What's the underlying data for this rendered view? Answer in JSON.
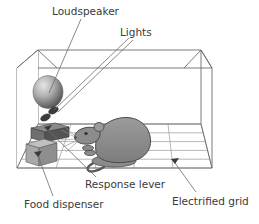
{
  "figure": {
    "background_color": "#ffffff",
    "line_color": "#6b6b6b",
    "label_color": "#3a3a3a"
  },
  "labels": {
    "loudspeaker": "Loudspeaker",
    "lights": "Lights",
    "response_lever": "Response lever",
    "food_dispenser": "Food dispenser",
    "electrified_grid": "Electrified grid"
  },
  "parts": {
    "chamber": {
      "name": "chamber-box",
      "stroke": "#6b6b6b"
    },
    "loudspeaker": {
      "name": "loudspeaker-cone",
      "fill_light": "#d9d9d9",
      "fill_dark": "#4a4a4a"
    },
    "light_upper": {
      "name": "light-upper",
      "fill": "#3c3c3c"
    },
    "light_lower": {
      "name": "light-lower",
      "fill": "#3c3c3c"
    },
    "lever": {
      "name": "response-lever",
      "fill_top": "#8a8a8a",
      "fill_front": "#6a6a6a",
      "fill_side": "#4f4f4f"
    },
    "dispenser": {
      "name": "food-dispenser",
      "fill_top": "#b5b5b5",
      "fill_front": "#9a9a9a",
      "fill_side": "#808080"
    },
    "rat": {
      "name": "rat",
      "body_fill": "#8c8c8c",
      "outline": "#4a4a4a"
    },
    "grid": {
      "name": "electrified-grid-floor",
      "stroke": "#9a9a9a",
      "horizontal_lines": 5,
      "diagonal_lines": 5
    }
  }
}
